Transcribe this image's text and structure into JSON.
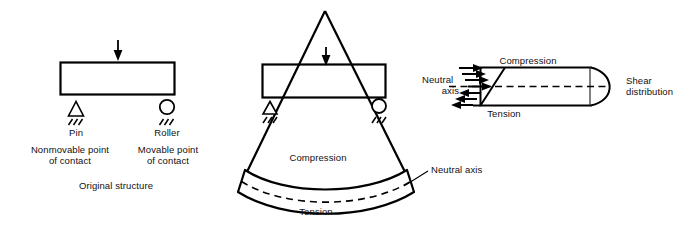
{
  "figure": {
    "stroke_color": "#000000",
    "background_color": "#ffffff",
    "width": 691,
    "height": 233
  },
  "panel_original": {
    "name": "Original structure",
    "caption": "Original structure",
    "load_arrow": "downward-load-arrow",
    "beam": "rectangular-beam",
    "left_support": {
      "type": "pin",
      "label": "Pin",
      "description_line1": "Nonmovable point",
      "description_line2": "of contact"
    },
    "right_support": {
      "type": "roller",
      "label": "Roller",
      "description_line1": "Movable point",
      "description_line2": "of contact"
    }
  },
  "panel_deflected": {
    "name": "Deflected structure",
    "load_arrow": "downward-load-arrow",
    "beam": "rectangular-beam",
    "left_support": {
      "type": "pin"
    },
    "right_support": {
      "type": "roller"
    },
    "deflection_rays": "two-diverging-rays-from-apex",
    "curved_beam": {
      "top_label": "Compression",
      "bottom_label": "Tension",
      "neutral_axis_label": "Neutral axis"
    }
  },
  "panel_stress": {
    "name": "Stress distribution detail",
    "neutral_axis_label_line1": "Neutral",
    "neutral_axis_label_line2": "axis",
    "compression_label": "Compression",
    "tension_label": "Tension",
    "shear_label_line1": "Shear",
    "shear_label_line2": "distribution",
    "compression_arrows": 4,
    "tension_arrows": 4,
    "arrow_direction_compression": "right",
    "arrow_direction_tension": "left",
    "shear_curve": "parabolic"
  }
}
